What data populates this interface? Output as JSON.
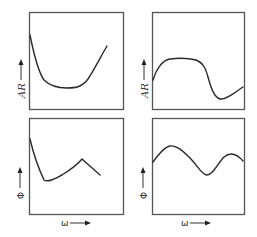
{
  "figure": {
    "panels": [
      {
        "id": "top-left",
        "ylabel": "AR",
        "xlabel": "",
        "description": "Amplitude ratio decreasing sharply then rising"
      },
      {
        "id": "top-right",
        "ylabel": "AR",
        "xlabel": "",
        "description": "Amplitude ratio rising to plateau, dropping, then rising slightly"
      },
      {
        "id": "bottom-left",
        "ylabel": "Φ",
        "xlabel": "ω",
        "description": "Phase dropping sharply, rising to peak, then falling"
      },
      {
        "id": "bottom-right",
        "ylabel": "Φ",
        "xlabel": "ω",
        "description": "Phase oscillating wave"
      }
    ],
    "ylabel_amp": "AR",
    "ylabel_phase": "Φ",
    "xlabel": "ω"
  },
  "colors": {
    "frame": "#555555",
    "curve": "#2a2a2a",
    "background": "#ffffff"
  }
}
